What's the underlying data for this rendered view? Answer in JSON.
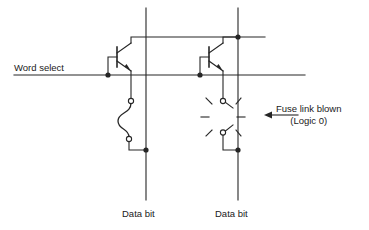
{
  "diagram": {
    "stroke_color": "#262626",
    "text_color": "#1a1a1a",
    "background": "#ffffff"
  },
  "labels": {
    "word_select": "Word select",
    "data_bit_left": "Data bit",
    "data_bit_right": "Data bit",
    "fuse_blown_line1": "Fuse link blown",
    "fuse_blown_line2": "(Logic 0)"
  },
  "cells": [
    {
      "name": "left-cell",
      "fuse_state": "intact",
      "logic_value": "1",
      "data_bit_label": "Data bit"
    },
    {
      "name": "right-cell",
      "fuse_state": "blown",
      "logic_value": "0",
      "data_bit_label": "Data bit"
    }
  ],
  "geometry": {
    "word_select_y": 75,
    "collector_rail_y": 37,
    "data_bit_x_left": 146,
    "data_bit_x_right": 238,
    "bottom_node_y": 150
  }
}
